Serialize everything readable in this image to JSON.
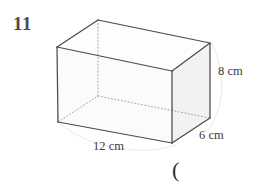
{
  "figure": {
    "problem_number": "11",
    "shape_name": "cuboid",
    "stray_mark": "(",
    "colors": {
      "edge_visible": "#4a4a4a",
      "edge_hidden": "#9a9a9a",
      "face_fill": "#fbfbfb",
      "face_fill_side": "#f4f4f4",
      "face_fill_top": "#fdfdfd",
      "label_text": "#3a3a3a",
      "number_text": "#4a4a4a",
      "background": "#ffffff"
    },
    "labels": {
      "height": "8 cm",
      "depth": "6 cm",
      "width": "12 cm"
    },
    "dimensions": {
      "width_value": 12,
      "depth_value": 6,
      "height_value": 8,
      "unit": "cm"
    },
    "vertices": {
      "front_top_left": [
        57,
        47
      ],
      "front_top_right": [
        172,
        71
      ],
      "front_bottom_left": [
        58,
        122
      ],
      "front_bottom_right": [
        172,
        143
      ],
      "back_top_left": [
        98,
        20
      ],
      "back_top_right": [
        210,
        43
      ],
      "back_bottom_right": [
        210,
        118
      ],
      "back_bottom_left": [
        98,
        96
      ]
    }
  }
}
